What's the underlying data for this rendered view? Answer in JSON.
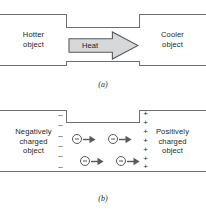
{
  "figure": {
    "colors": {
      "line": "#6d6e71",
      "text": "#231f20",
      "arrow_fill": "#d7d8d9",
      "arrow_stroke": "#58595b",
      "background": "#ffffff"
    }
  },
  "panel_a": {
    "caption": "(a)",
    "left_object": {
      "line1": "Hotter",
      "line2": "object"
    },
    "right_object": {
      "line1": "Cooler",
      "line2": "object"
    },
    "flow_arrow": {
      "label": "Heat",
      "direction": "right",
      "icon": "block-arrow-right-icon"
    }
  },
  "panel_b": {
    "caption": "(b)",
    "left_object": {
      "line1": "Negatively",
      "line2": "charged",
      "line3": "object"
    },
    "right_object": {
      "line1": "Positively",
      "line2": "charged",
      "line3": "object"
    },
    "left_signs": {
      "symbol": "–",
      "count": 6
    },
    "right_signs": {
      "symbol": "+",
      "count": 7
    },
    "electron_rows": [
      {
        "row": 1,
        "electrons": [
          {
            "symbol": "–",
            "arrow": "arrow-right-icon",
            "x": 6
          },
          {
            "symbol": "–",
            "arrow": "arrow-right-icon",
            "x": 42
          }
        ]
      },
      {
        "row": 2,
        "electrons": [
          {
            "symbol": "–",
            "arrow": "arrow-right-icon",
            "x": 14
          },
          {
            "symbol": "–",
            "arrow": "arrow-right-icon",
            "x": 50
          }
        ]
      }
    ]
  }
}
